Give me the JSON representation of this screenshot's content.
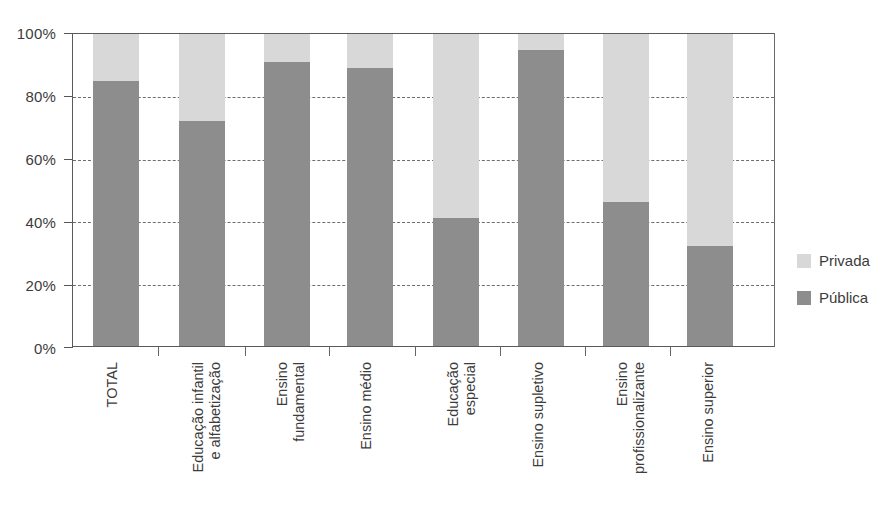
{
  "chart_data": {
    "type": "bar",
    "subtype": "stacked-100-percent",
    "title": "",
    "xlabel": "",
    "ylabel": "",
    "ylim": [
      0,
      100
    ],
    "ytick_labels": [
      "100%",
      "80%",
      "60%",
      "40%",
      "20%",
      "0%"
    ],
    "ytick_values": [
      100,
      80,
      60,
      40,
      20,
      0
    ],
    "grid": "horizontal-dashed",
    "legend_position": "right",
    "categories": [
      "TOTAL",
      "Educação infantil\ne alfabetização",
      "Ensino\nfundamental",
      "Ensino médio",
      "Educação\nespecial",
      "Ensino supletivo",
      "Ensino\nprofissionalizante",
      "Ensino superior"
    ],
    "series": [
      {
        "name": "Pública",
        "color": "#8d8d8d",
        "values": [
          85,
          72,
          91,
          89,
          41,
          95,
          46,
          32
        ]
      },
      {
        "name": "Privada",
        "color": "#d8d8d8",
        "values": [
          15,
          28,
          9,
          11,
          59,
          5,
          54,
          68
        ]
      }
    ]
  },
  "legend": {
    "items": [
      {
        "label": "Privada",
        "swatch": "light-gray-swatch"
      },
      {
        "label": "Pública",
        "swatch": "dark-gray-swatch"
      }
    ]
  },
  "source_note": ""
}
